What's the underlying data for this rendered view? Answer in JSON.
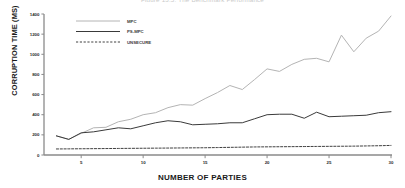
{
  "figure": {
    "title": "Figure 13.5: The Benchmark Performance",
    "background": "#ffffff"
  },
  "axes": {
    "ylabel": "CORRUPTION TIME (MS)",
    "xlabel": "NUMBER OF PARTIES",
    "yticks": [
      "0",
      "200",
      "400",
      "600",
      "800",
      "1000",
      "1200",
      "1400"
    ],
    "xticks": [
      "5",
      "10",
      "15",
      "20",
      "25",
      "30"
    ],
    "axis_color": "#8a8a8a"
  },
  "legend": {
    "position": "top-left-inside",
    "entries": [
      {
        "label": "MPC",
        "color": "#b4b4b4",
        "style": "solid"
      },
      {
        "label": "PS-MPC",
        "color": "#3a3a3a",
        "style": "solid"
      },
      {
        "label": "UNSECURE",
        "color": "#2a2a2a",
        "style": "dashed"
      }
    ]
  },
  "chart_data": {
    "type": "line",
    "title": "Figure 13.5: The Benchmark Performance",
    "xlabel": "NUMBER OF PARTIES",
    "ylabel": "CORRUPTION TIME (MS)",
    "xlim": [
      2,
      30
    ],
    "ylim": [
      0,
      1400
    ],
    "grid": false,
    "legend_position": "top-left-inside",
    "x": [
      3,
      4,
      5,
      6,
      7,
      8,
      9,
      10,
      11,
      12,
      13,
      14,
      15,
      16,
      17,
      18,
      19,
      20,
      21,
      22,
      23,
      24,
      25,
      26,
      27,
      28,
      29,
      30
    ],
    "series": [
      {
        "name": "MPC",
        "color": "#b4b4b4",
        "style": "solid",
        "values": [
          190,
          155,
          215,
          270,
          275,
          330,
          355,
          400,
          420,
          470,
          500,
          495,
          560,
          620,
          690,
          650,
          750,
          855,
          830,
          900,
          950,
          960,
          925,
          1190,
          1025,
          1160,
          1230,
          1380
        ]
      },
      {
        "name": "PS-MPC",
        "color": "#3a3a3a",
        "style": "solid",
        "values": [
          190,
          155,
          220,
          230,
          250,
          270,
          260,
          290,
          320,
          340,
          330,
          300,
          305,
          310,
          320,
          320,
          360,
          400,
          405,
          405,
          365,
          425,
          380,
          385,
          390,
          395,
          420,
          430
        ]
      },
      {
        "name": "UNSECURE",
        "color": "#2a2a2a",
        "style": "dashed",
        "values": [
          60,
          61,
          62,
          63,
          64,
          65,
          66,
          67,
          68,
          69,
          70,
          71,
          72,
          74,
          76,
          78,
          80,
          81,
          82,
          83,
          84,
          85,
          86,
          87,
          88,
          90,
          92,
          95
        ]
      }
    ]
  }
}
